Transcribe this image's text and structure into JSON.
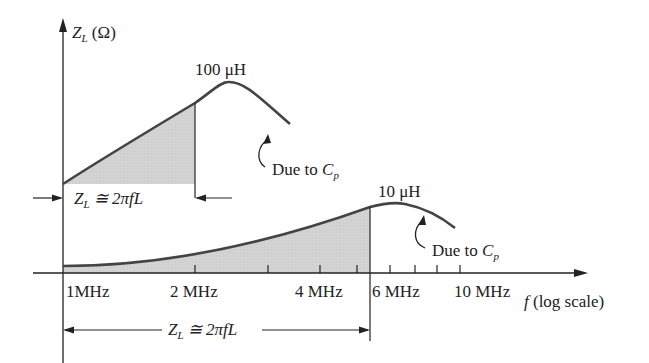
{
  "diagram": {
    "y_axis_label": {
      "main": "Z",
      "sub": "L",
      "unit": "(Ω)"
    },
    "x_axis_label": {
      "var": "f",
      "rest": "(log scale)"
    },
    "ticks": [
      {
        "label": "1MHz",
        "x": 63
      },
      {
        "label": "2 MHz",
        "x": 195
      },
      {
        "label": "4 MHz",
        "x": 320
      },
      {
        "label": "6 MHz",
        "x": 390
      },
      {
        "label": "10 MHz",
        "x": 484
      }
    ],
    "minor_tick_xs": [
      63,
      195,
      268,
      320,
      357,
      390,
      415,
      437,
      460,
      484
    ],
    "curves": [
      {
        "label": "100 μH",
        "annotation": "Due to",
        "annotation_sym": "C",
        "annotation_sub": "p"
      },
      {
        "label": "10 μH",
        "annotation": "Due to",
        "annotation_sym": "C",
        "annotation_sub": "p"
      }
    ],
    "linear_region_label": {
      "z": "Z",
      "sub": "L",
      "eq": "≅ 2πfL"
    },
    "colors": {
      "line": "#444444",
      "shade": "#d0d0d0",
      "axis": "#222222"
    }
  }
}
